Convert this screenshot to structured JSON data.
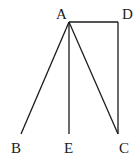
{
  "diagram": {
    "points": {
      "A": {
        "label": "A",
        "x": 69,
        "y": 22,
        "lx": 56,
        "ly": 19
      },
      "D": {
        "label": "D",
        "x": 118,
        "y": 22,
        "lx": 122,
        "ly": 19
      },
      "B": {
        "label": "B",
        "x": 21,
        "y": 134,
        "lx": 11,
        "ly": 153
      },
      "E": {
        "label": "E",
        "x": 69,
        "y": 134,
        "lx": 64,
        "ly": 153
      },
      "C": {
        "label": "C",
        "x": 118,
        "y": 134,
        "lx": 119,
        "ly": 153
      }
    },
    "segments": [
      [
        "A",
        "D"
      ],
      [
        "D",
        "C"
      ],
      [
        "A",
        "B"
      ],
      [
        "A",
        "E"
      ],
      [
        "A",
        "C"
      ]
    ],
    "line_color": "#1a1a1a"
  }
}
